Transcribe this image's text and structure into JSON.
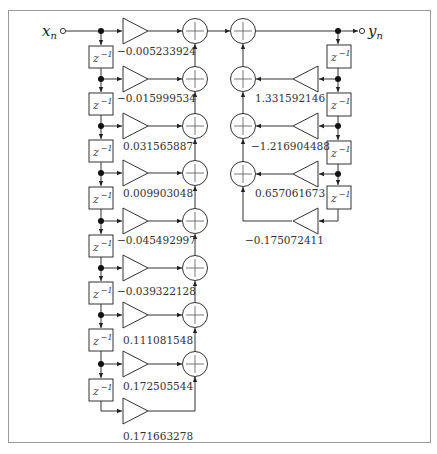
{
  "diagram": {
    "input_label": "x",
    "input_subscript": "n",
    "output_label": "y",
    "output_subscript": "n",
    "delay_label": "z",
    "delay_exponent": "−1",
    "feedforward_coefficients": [
      "−0.005233924",
      "−0.015999534",
      "0.031565887",
      "0.009903048",
      "−0.045492997",
      "−0.039322128",
      "0.111081548",
      "0.172505544",
      "0.171663278"
    ],
    "feedback_coefficients": [
      "1.331592146",
      "−1.216904488",
      "0.657061673",
      "−0.175072411"
    ]
  }
}
